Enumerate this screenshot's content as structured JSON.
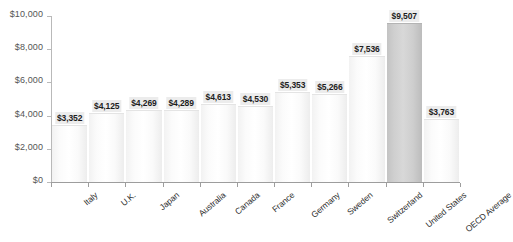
{
  "chart_data": {
    "type": "bar",
    "title": "",
    "subtitle": "",
    "xlabel": "",
    "ylabel": "",
    "ylim": [
      0,
      10000
    ],
    "grid": false,
    "legend": "none",
    "y_ticks": [
      "$0",
      "$2,000",
      "$4,000",
      "$6,000",
      "$8,000",
      "$10,000"
    ],
    "y_tick_values": [
      0,
      2000,
      4000,
      6000,
      8000,
      10000
    ],
    "categories": [
      "Italy",
      "U.K.",
      "Japan",
      "Australia",
      "Canada",
      "France",
      "Germany",
      "Sweden",
      "Switzerland",
      "United States",
      "OECD Average"
    ],
    "values": [
      3352,
      4125,
      4269,
      4289,
      4613,
      4530,
      5353,
      5266,
      7536,
      9507,
      3763
    ],
    "labels": [
      "$3,352",
      "$4,125",
      "$4,269",
      "$4,289",
      "$4,613",
      "$4,530",
      "$5,353",
      "$5,266",
      "$7,536",
      "$9,507",
      "$3,763"
    ],
    "highlight_index": 9,
    "colors": {
      "bar_fill": "#fbfbfb",
      "bar_fill_highlight": "#cfcfcf",
      "axis": "#9d9d9d",
      "tick_text": "#555555",
      "value_text": "#1d1d1d",
      "value_background": "#ececec",
      "category_text": "#2b2b2b",
      "background": "#ffffff"
    }
  }
}
